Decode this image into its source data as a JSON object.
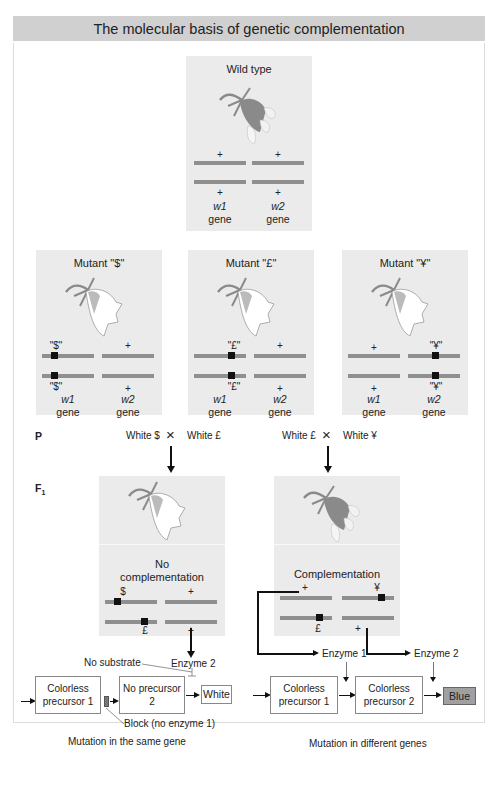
{
  "title": "The molecular basis of genetic complementation",
  "colors": {
    "title_bg": "#d0d0d0",
    "panel_bg": "#ebebeb",
    "gene_bar": "#8f8f8f",
    "mutation": "#111111",
    "blue_box": "#a0a0a0",
    "flower_wild": "#8a8a8a",
    "flower_white": "#ffffff"
  },
  "wild_type": {
    "title": "Wild type",
    "icon": "flower-pigmented-icon",
    "w1": {
      "top": "+",
      "bottom": "+"
    },
    "w2": {
      "top": "+",
      "bottom": "+"
    },
    "gene1": "w1",
    "gene2": "w2",
    "gene_word": "gene"
  },
  "mutants": [
    {
      "title": "Mutant \"$\"",
      "icon": "flower-white-icon",
      "w1_top": "\"$\"",
      "w1_bottom": "\"$\"",
      "w2_top": "+",
      "w2_bottom": "+",
      "gene1": "w1",
      "gene2": "w2",
      "gene_word": "gene"
    },
    {
      "title": "Mutant \"£\"",
      "icon": "flower-white-icon",
      "w1_top": "\"£\"",
      "w1_bottom": "\"£\"",
      "w2_top": "+",
      "w2_bottom": "+",
      "gene1": "w1",
      "gene2": "w2",
      "gene_word": "gene"
    },
    {
      "title": "Mutant \"¥\"",
      "icon": "flower-white-icon",
      "w1_top": "+",
      "w1_bottom": "+",
      "w2_top": "\"¥\"",
      "w2_bottom": "\"¥\"",
      "gene1": "w1",
      "gene2": "w2",
      "gene_word": "gene"
    }
  ],
  "generations": {
    "p": "P",
    "f1": "F",
    "f1_sub": "1"
  },
  "crosses": [
    {
      "left": "White $",
      "symbol": "×",
      "right": "White £"
    },
    {
      "left": "White £",
      "symbol": "×",
      "right": "White ¥"
    }
  ],
  "f1_left": {
    "title_line1": "No",
    "title_line2": "complementation",
    "top_w1": "$",
    "top_w2": "+",
    "bottom_w1": "£",
    "bottom_w2": "+"
  },
  "f1_right": {
    "title": "Complementation",
    "top_w1": "+",
    "top_w2": "¥",
    "bottom_w1": "£",
    "bottom_w2": "+"
  },
  "pathway_left": {
    "enzyme2": "Enzyme 2",
    "no_substrate": "No substrate",
    "box1": "Colorless precursor 1",
    "box2": "No precursor 2",
    "result": "White",
    "block": "Block (no enzyme 1)",
    "caption": "Mutation in the same gene"
  },
  "pathway_right": {
    "enzyme1": "Enzyme 1",
    "enzyme2": "Enzyme 2",
    "box1": "Colorless precursor 1",
    "box2": "Colorless precursor 2",
    "result": "Blue",
    "caption": "Mutation in different genes"
  }
}
